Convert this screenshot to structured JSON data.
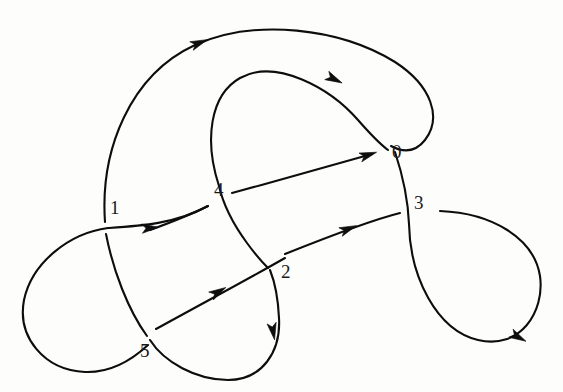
{
  "figure": {
    "kind": "knot-diagram",
    "background_color": "#fdfdfc",
    "stroke_color": "#0d0d0d",
    "width": 563,
    "height": 392
  },
  "crossing_labels": [
    {
      "id": "0",
      "text": "0",
      "x": 392,
      "y": 142,
      "over_strand": "outer-top-right-arc",
      "under_strand": "descending-arc-to-3"
    },
    {
      "id": "1",
      "text": "1",
      "x": 110,
      "y": 198,
      "over_strand": "lower-left-horizontal-arc",
      "under_strand": "left-vertical-arc"
    },
    {
      "id": "2",
      "text": "2",
      "x": 281,
      "y": 262,
      "over_strand": "long-diagonal-arc",
      "under_strand": "inner-loop-tail"
    },
    {
      "id": "3",
      "text": "3",
      "x": 414,
      "y": 193,
      "over_strand": "vertical-arc-from-0",
      "under_strand": "right-horizontal-arc"
    },
    {
      "id": "4",
      "text": "4",
      "x": 214,
      "y": 180,
      "over_strand": "inner-loop-descending",
      "under_strand": "diagonal-arc-to-0"
    },
    {
      "id": "5",
      "text": "5",
      "x": 140,
      "y": 341,
      "over_strand": "left-loop-descending",
      "under_strand": "diagonal-from-bottom-left"
    }
  ],
  "strands": [
    {
      "name": "outer-big-arc",
      "role": "outer boundary sweeping from crossing 1 up and over to the right, down toward crossing 0",
      "d": "M 105 222 C 100 150 130 75 195 45 C 255 18 340 28 395 62 C 432 86 442 118 425 140 C 414 154 402 152 391 146"
    },
    {
      "name": "inner-loop-top",
      "role": "inner loop rising from crossing 4 region, arcing right and descending to crossing 0",
      "d": "M 219 186 C 204 140 210 95 240 78 C 276 58 330 88 358 120 C 372 136 380 144 388 150"
    },
    {
      "name": "inner-loop-tail",
      "role": "inner loop tail descending through crossing 4 (over) and ending under crossing 2",
      "d": "M 219 186 C 224 208 236 228 247 243 C 255 254 262 262 268 268"
    },
    {
      "name": "diagonal-arc-to-0",
      "role": "long diagonal passing under crossing 4 and continuing up-right to crossing 0 (under)",
      "d": "M 232 193 C 280 180 330 166 372 154"
    },
    {
      "name": "diagonal-arc-left-of-4",
      "role": "segment of the same diagonal on the lower-left side of crossing 4",
      "d": "M 150 230 C 172 222 192 214 208 206"
    },
    {
      "name": "vertical-arc-0-to-3",
      "role": "near-vertical arc descending from crossing 0 through crossing 3 (over) into the right loop",
      "d": "M 395 152 C 403 176 408 200 409 224"
    },
    {
      "name": "right-teardrop-loop",
      "role": "large teardrop loop on the right, leaving crossing 3 and returning to it",
      "d": "M 409 224 C 410 276 436 330 478 340 C 520 350 545 312 540 276 C 534 238 492 213 440 211"
    },
    {
      "name": "right-horizontal-arc",
      "role": "horizontal arc approaching crossing 3 from the left, broken at crossing 3 (under)",
      "d": "M 285 254 C 330 236 372 220 400 213"
    },
    {
      "name": "long-diagonal-arc",
      "role": "long diagonal rising left-to-right, over crossing 2, from the lower-left under-pass at crossing 5",
      "d": "M 156 329 C 205 302 250 278 285 258"
    },
    {
      "name": "left-loop",
      "role": "left teardrop loop from crossing 1 sweeping left, down and round to crossing 5",
      "d": "M 108 228 C 70 233 32 262 24 300 C 17 337 44 370 85 372 C 112 373 134 358 148 345"
    },
    {
      "name": "lower-left-horizontal-arc",
      "role": "horizontal arc passing over crossing 1 and rising to the right toward crossing 4",
      "d": "M 108 228 C 140 226 175 224 208 206"
    },
    {
      "name": "left-vertical-descending",
      "role": "near-vertical strand passing under crossing 1 and descending to crossing 5 (over)",
      "d": "M 106 234 C 113 270 128 310 147 336"
    },
    {
      "name": "bottom-loop",
      "role": "lower bottom loop from crossing 5 down and round up to the crossing 2 tail",
      "d": "M 150 340 C 164 362 196 380 228 380 C 262 380 281 352 279 318 C 278 296 274 280 270 270"
    }
  ],
  "arrowheads": [
    {
      "name": "arrow-upper-left",
      "x": 199,
      "y": 43,
      "angle": -22,
      "on_strand": "outer-big-arc"
    },
    {
      "name": "arrow-inner-loop-top",
      "x": 334,
      "y": 79,
      "angle": 26,
      "on_strand": "inner-loop-top"
    },
    {
      "name": "arrow-into-0",
      "x": 368,
      "y": 155,
      "angle": -18,
      "on_strand": "diagonal-arc-to-0"
    },
    {
      "name": "arrow-crossing-1-right",
      "x": 150,
      "y": 228,
      "angle": -5,
      "on_strand": "lower-left-horizontal-arc"
    },
    {
      "name": "arrow-toward-3",
      "x": 348,
      "y": 229,
      "angle": -22,
      "on_strand": "right-horizontal-arc"
    },
    {
      "name": "arrow-long-diagonal",
      "x": 218,
      "y": 292,
      "angle": -30,
      "on_strand": "long-diagonal-arc"
    },
    {
      "name": "arrow-bottom-loop",
      "x": 273,
      "y": 331,
      "angle": 80,
      "on_strand": "bottom-loop"
    },
    {
      "name": "arrow-right-loop",
      "x": 518,
      "y": 337,
      "angle": 28,
      "on_strand": "right-teardrop-loop"
    }
  ]
}
